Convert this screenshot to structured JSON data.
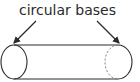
{
  "diagram": {
    "label": "circular bases",
    "shape": "cylinder",
    "arrows": [
      "left base",
      "right base"
    ],
    "colors": {
      "stroke": "#2a2a2a",
      "hidden_edge": "#777777",
      "background": "#ffffff"
    }
  }
}
